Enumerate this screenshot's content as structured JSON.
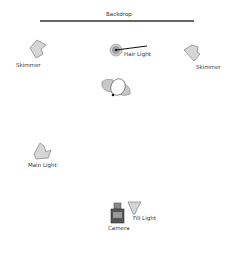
{
  "diagram": {
    "backdrop": {
      "label": "Backdrop"
    },
    "elements": [
      {
        "id": "skimmer-left",
        "label": "Skimmer"
      },
      {
        "id": "hair-light",
        "label": "Hair Light"
      },
      {
        "id": "skimmer-right",
        "label": "Skimmer"
      },
      {
        "id": "subject",
        "label": ""
      },
      {
        "id": "main-light",
        "label": "Main Light"
      },
      {
        "id": "camera",
        "label": "Camera"
      },
      {
        "id": "fill-light",
        "label": "Fill Light"
      }
    ],
    "colors": {
      "light_fill": "#d6d6d6",
      "light_stroke": "#8a8a8a",
      "line": "#222222",
      "camera_body": "#555555",
      "camera_lens": "#888888"
    }
  }
}
